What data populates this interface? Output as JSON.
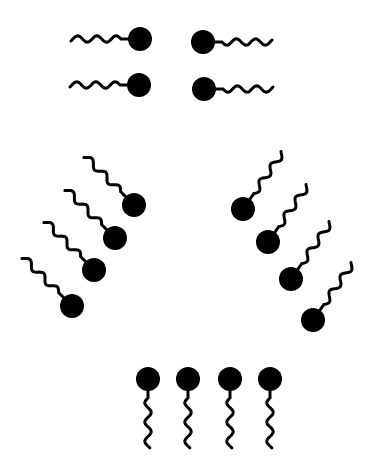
{
  "diagram": {
    "title": "",
    "colors": {
      "molecule": "#000000",
      "background": "#ffffff"
    },
    "head_radius": 12,
    "groups": [
      {
        "name": "pairs-horizontal",
        "molecules": [
          {
            "head": [
              140,
              39
            ],
            "tail_angle": 180
          },
          {
            "head": [
              139,
              85
            ],
            "tail_angle": 180
          },
          {
            "head": [
              203,
              42
            ],
            "tail_angle": 0
          },
          {
            "head": [
              204,
              89
            ],
            "tail_angle": 0
          }
        ]
      },
      {
        "name": "left-diagonal-row",
        "molecules": [
          {
            "head": [
              134,
              205
            ],
            "tail_angle": 225
          },
          {
            "head": [
              115,
              238
            ],
            "tail_angle": 225
          },
          {
            "head": [
              94,
              270
            ],
            "tail_angle": 225
          },
          {
            "head": [
              72,
              306
            ],
            "tail_angle": 225
          }
        ]
      },
      {
        "name": "right-diagonal-row",
        "molecules": [
          {
            "head": [
              243,
              209
            ],
            "tail_angle": 305
          },
          {
            "head": [
              268,
              242
            ],
            "tail_angle": 305
          },
          {
            "head": [
              291,
              279
            ],
            "tail_angle": 305
          },
          {
            "head": [
              313,
              320
            ],
            "tail_angle": 305
          }
        ]
      },
      {
        "name": "bottom-row",
        "molecules": [
          {
            "head": [
              148,
              379
            ],
            "tail_angle": 90
          },
          {
            "head": [
              188,
              379
            ],
            "tail_angle": 90
          },
          {
            "head": [
              230,
              379
            ],
            "tail_angle": 90
          },
          {
            "head": [
              270,
              379
            ],
            "tail_angle": 90
          }
        ]
      }
    ]
  }
}
